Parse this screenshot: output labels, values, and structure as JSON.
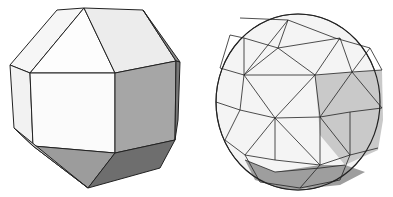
{
  "figure": {
    "panels": [
      {
        "name": "rhombicuboctahedron",
        "description": "Polyhedron with square and triangular faces, shaded"
      },
      {
        "name": "geodesic-sphere",
        "description": "Triangulated geodesic sphere, shaded"
      }
    ],
    "colors": {
      "light": "#fbfbfb",
      "mid": "#e2e2e2",
      "gray": "#a9a9a9",
      "dark": "#7a7a7a",
      "edge": "#222222"
    }
  }
}
